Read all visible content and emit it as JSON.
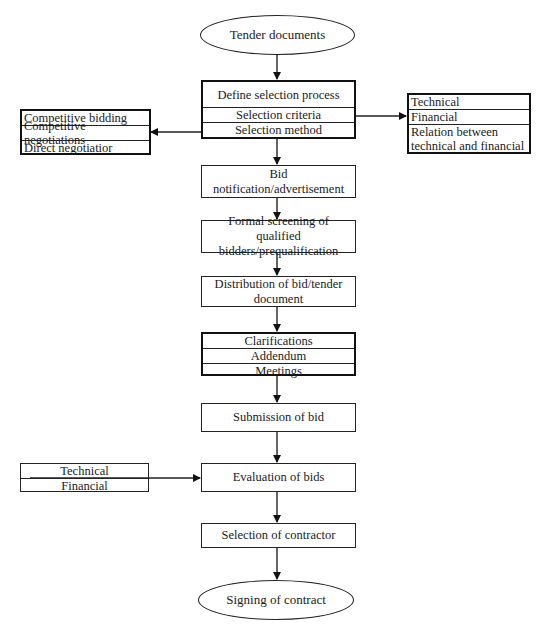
{
  "diagram": {
    "start": {
      "label": "Tender documents"
    },
    "define_process": {
      "rows": [
        "Define selection process",
        "Selection criteria",
        "Selection method"
      ]
    },
    "selection_methods": {
      "rows": [
        "Competitive bidding",
        "Competitive negotiations",
        "Direct negotiatior"
      ]
    },
    "selection_criteria": {
      "rows": [
        "Technical",
        "Financial",
        "Relation between technical and financial"
      ]
    },
    "steps": [
      {
        "label": "Bid notification/advertisement"
      },
      {
        "label": "Formal screening of qualified bidders/prequalification"
      },
      {
        "label": "Distribution of bid/tender document"
      }
    ],
    "clarifications": {
      "rows": [
        "Clarifications",
        "Addendum",
        "Meetings"
      ]
    },
    "submission": {
      "label": "Submission of bid"
    },
    "evaluation": {
      "label": "Evaluation of bids"
    },
    "evaluation_inputs": {
      "rows": [
        "Technical",
        "Financial"
      ]
    },
    "selection": {
      "label": "Selection of contractor"
    },
    "end": {
      "label": "Signing of contract"
    },
    "colors": {
      "stroke": "#222222",
      "background": "#ffffff",
      "text": "#1a1a1a"
    }
  }
}
